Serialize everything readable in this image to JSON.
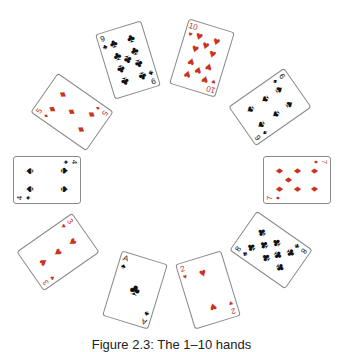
{
  "figure": {
    "caption": "Figure 2.3: The 1–10 hands",
    "colors": {
      "red": "#c8341c",
      "black": "#111111",
      "border": "#8a8a8a"
    }
  },
  "cards": [
    {
      "rank": "A",
      "suit": "♣",
      "suit_name": "clubs",
      "color": "black",
      "x": 135,
      "y": 290,
      "rot": 17,
      "landscape": false
    },
    {
      "rank": "2",
      "suit": "♥",
      "suit_name": "hearts",
      "color": "red",
      "x": 208,
      "y": 290,
      "rot": -17,
      "landscape": false
    },
    {
      "rank": "3",
      "suit": "♥",
      "suit_name": "hearts",
      "color": "red",
      "x": 58,
      "y": 252,
      "rot": 55,
      "landscape": false
    },
    {
      "rank": "4",
      "suit": "♠",
      "suit_name": "spades",
      "color": "black",
      "x": 47,
      "y": 180,
      "rot": 90,
      "landscape": false
    },
    {
      "rank": "5",
      "suit": "♦",
      "suit_name": "diamonds",
      "color": "red",
      "x": 72,
      "y": 112,
      "rot": 125,
      "landscape": false
    },
    {
      "rank": "6",
      "suit": "♠",
      "suit_name": "spades",
      "color": "black",
      "x": 270,
      "y": 107,
      "rot": 235,
      "landscape": false
    },
    {
      "rank": "7",
      "suit": "♦",
      "suit_name": "diamonds",
      "color": "red",
      "x": 297,
      "y": 180,
      "rot": 270,
      "landscape": false
    },
    {
      "rank": "8",
      "suit": "♣",
      "suit_name": "clubs",
      "color": "black",
      "x": 271,
      "y": 250,
      "rot": 305,
      "landscape": false
    },
    {
      "rank": "9",
      "suit": "♣",
      "suit_name": "clubs",
      "color": "black",
      "x": 128,
      "y": 60,
      "rot": 163,
      "landscape": false
    },
    {
      "rank": "10",
      "suit": "♥",
      "suit_name": "hearts",
      "color": "red",
      "x": 202,
      "y": 58,
      "rot": 197,
      "landscape": false
    }
  ]
}
